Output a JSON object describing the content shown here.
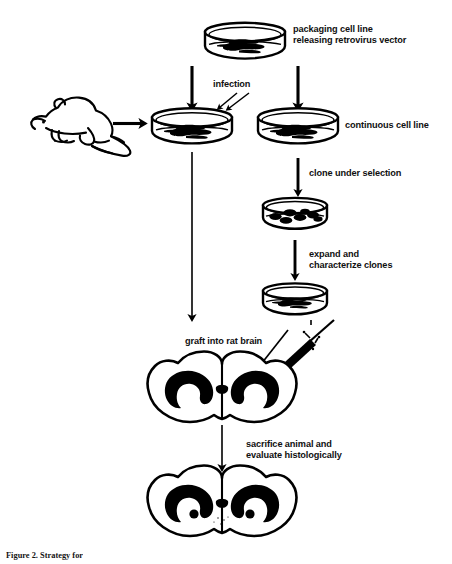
{
  "figure": {
    "caption": "Figure 2. Strategy for",
    "background_color": "#ffffff",
    "ink_color": "#000000"
  },
  "labels": {
    "packaging_line": "packaging cell line",
    "releasing_vector": "releasing retrovirus vector",
    "infection": "infection",
    "continuous_cell_line": "continuous cell line",
    "clone_under_selection": "clone under selection",
    "expand": "expand and",
    "characterize": "characterize clones",
    "graft_into_rat_brain": "graft into rat brain",
    "sacrifice": "sacrifice animal and",
    "evaluate": "evaluate histologically"
  },
  "nodes": [
    {
      "id": "packaging-dish",
      "type": "petri-dish",
      "contents": "confluent-cells",
      "label": "packaging cell line releasing retrovirus vector"
    },
    {
      "id": "rat",
      "type": "rodent-illustration",
      "label": "rat"
    },
    {
      "id": "primary-dish",
      "type": "petri-dish",
      "contents": "confluent-cells",
      "label": "infected primary culture"
    },
    {
      "id": "continuous-dish",
      "type": "petri-dish",
      "contents": "confluent-cells",
      "label": "continuous cell line"
    },
    {
      "id": "clone-dish",
      "type": "petri-dish",
      "contents": "discrete-colonies",
      "colony_count": 7,
      "label": "cloned colonies under selection"
    },
    {
      "id": "expanded-dish",
      "type": "petri-dish",
      "contents": "confluent-cells",
      "label": "expanded characterized clone"
    },
    {
      "id": "brain-graft",
      "type": "brain-coronal-section",
      "has_needle": true,
      "label": "rat brain receiving graft"
    },
    {
      "id": "brain-histology",
      "type": "brain-coronal-section",
      "has_graft_deposits": true,
      "graft_count": 2,
      "label": "rat brain evaluated histologically"
    },
    {
      "id": "syringe",
      "type": "syringe",
      "label": "injection syringe"
    }
  ],
  "arrows": [
    {
      "id": "packaging-to-primary",
      "from": "packaging-dish",
      "to": "primary-dish",
      "style": "thick-vertical"
    },
    {
      "id": "packaging-to-continuous",
      "from": "packaging-dish",
      "to": "continuous-dish",
      "style": "thick-vertical"
    },
    {
      "id": "rat-to-primary",
      "from": "rat",
      "to": "primary-dish",
      "style": "thick-horizontal"
    },
    {
      "id": "infection-pointer-a",
      "from": "infection",
      "to": "primary-dish",
      "style": "thin-diagonal"
    },
    {
      "id": "infection-pointer-b",
      "from": "infection",
      "to": "primary-dish",
      "style": "thin-diagonal"
    },
    {
      "id": "continuous-to-clone",
      "from": "continuous-dish",
      "to": "clone-dish",
      "style": "thick-vertical"
    },
    {
      "id": "clone-to-expanded",
      "from": "clone-dish",
      "to": "expanded-dish",
      "style": "thick-vertical"
    },
    {
      "id": "primary-to-brain",
      "from": "primary-dish",
      "to": "brain-graft",
      "style": "thin-long-vertical"
    },
    {
      "id": "expanded-to-syringe",
      "from": "expanded-dish",
      "to": "syringe",
      "style": "thin-long-vertical"
    },
    {
      "id": "needle-pointer",
      "from": "syringe",
      "to": "brain-graft",
      "style": "thin-diagonal"
    },
    {
      "id": "brain-to-histology",
      "from": "brain-graft",
      "to": "brain-histology",
      "style": "thin-vertical"
    }
  ]
}
